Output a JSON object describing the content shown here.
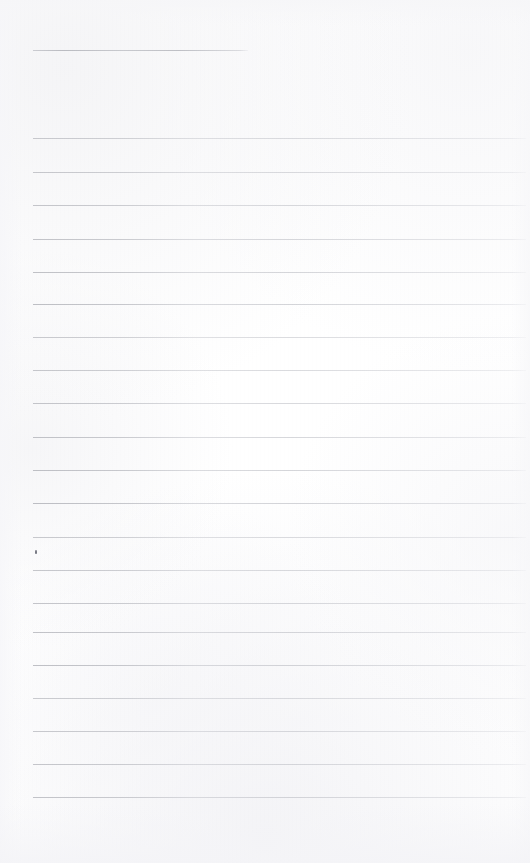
{
  "document": {
    "type": "lined-notebook-page",
    "title": "Blank ruled notebook page",
    "width": 530,
    "height": 863,
    "paper_color": "#fdfdfd",
    "rule_color": "#9ea0a8",
    "text_content": "",
    "is_blank": true
  },
  "header_rule": {
    "name": "title-rule",
    "x": 33,
    "y": 50,
    "width": 215,
    "thickness": 1
  },
  "body_rules": {
    "left": 33,
    "right": 526,
    "width": 493,
    "thickness": 1,
    "spacing": 33,
    "count": 20,
    "y_positions": [
      138,
      172,
      205,
      239,
      272,
      304,
      337,
      370,
      403,
      437,
      470,
      503,
      537,
      570,
      603,
      632,
      665,
      698,
      731,
      764,
      797
    ]
  },
  "marks": [
    {
      "name": "pencil-dot",
      "kind": "stray-pencil-mark",
      "x": 35,
      "y": 550,
      "color": "#787a84"
    }
  ],
  "margins": {
    "top": 50,
    "left": 33,
    "right": 4,
    "bottom": 66
  }
}
